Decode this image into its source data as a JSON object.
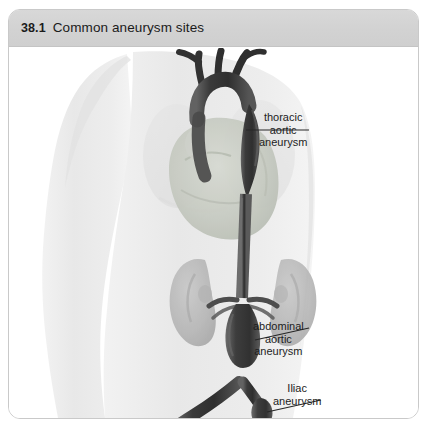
{
  "figure": {
    "number": "38.1",
    "caption": "Common aneurysm sites"
  },
  "labels": {
    "thoracic": {
      "line1": "thoracic",
      "line2": "aortic",
      "line3": "aneurysm"
    },
    "abdominal": {
      "line1": "abdominal",
      "line2": "aortic",
      "line3": "aneurysm"
    },
    "iliac": {
      "line1": "Iliac",
      "line2": "aneurysm"
    }
  },
  "colors": {
    "header_band": "#d4d4d4",
    "panel_border": "#c9c9c9",
    "body_silhouette": "#ebebeb",
    "aorta_dark": "#3c3c3c",
    "aorta_mid": "#4f4f4f",
    "heart": "#c9ccc4",
    "kidney": "#b6b6b6",
    "leader_line": "#2a2a2a",
    "label_text": "#1d1d1d"
  },
  "illustration": {
    "name": "anatomical-torso-aorta-diagram",
    "structures": [
      "body-silhouette",
      "heart",
      "aortic-arch",
      "ascending-aorta",
      "descending-thoracic-aorta",
      "left-kidney",
      "right-kidney",
      "renal-arteries",
      "abdominal-aorta",
      "common-iliac-arteries",
      "thoracic-aneurysm-bulge",
      "abdominal-aneurysm-bulge",
      "iliac-aneurysm-bulge"
    ]
  }
}
